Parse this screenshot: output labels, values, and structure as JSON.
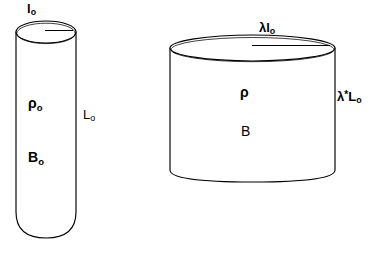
{
  "figure": {
    "type": "technical-diagram",
    "background_color": "#ffffff",
    "stroke_color": "#000000"
  },
  "left_cylinder": {
    "name": "reference-cylinder",
    "labels": {
      "top_radius": {
        "base": "l",
        "subscript": "o"
      },
      "density": {
        "base": "ρ",
        "subscript": "o"
      },
      "field": {
        "base": "B",
        "subscript": "o"
      },
      "length": {
        "base": "L",
        "subscript": "o"
      }
    },
    "geometry": {
      "left_x": 16,
      "right_x": 76,
      "top_y": 32,
      "bottom_y": 237,
      "ellipse_ry": 11
    }
  },
  "right_cylinder": {
    "name": "scaled-cylinder",
    "labels": {
      "top_radius": {
        "prefix": "λ",
        "base": "l",
        "subscript": "o"
      },
      "density": {
        "base": "ρ",
        "subscript": ""
      },
      "field": {
        "base": "B",
        "subscript": ""
      },
      "length": {
        "prefix": "λ",
        "star": "*",
        "base": "L",
        "subscript": "o"
      }
    },
    "geometry": {
      "left_x": 170,
      "right_x": 335,
      "top_y": 48,
      "bottom_y": 175,
      "ellipse_ry": 13
    }
  },
  "colors": {
    "stroke": "#000000",
    "fill": "#ffffff",
    "text": "#000000"
  }
}
